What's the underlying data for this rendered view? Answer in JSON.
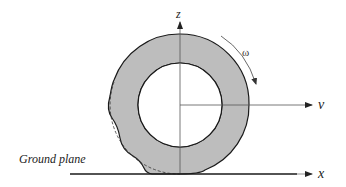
{
  "diagram": {
    "type": "tire-contact-schematic",
    "labels": {
      "z_axis": "z",
      "v_axis": "v",
      "x_axis": "x",
      "omega": "ω",
      "ground": "Ground plane"
    },
    "colors": {
      "tire_fill": "#bdbdbd",
      "outline": "#1a1a1a",
      "axis": "#555555",
      "background": "#ffffff"
    },
    "geometry": {
      "center": [
        180,
        105
      ],
      "outer_radius": 69,
      "inner_radius": 42,
      "ground_y": 174
    }
  }
}
